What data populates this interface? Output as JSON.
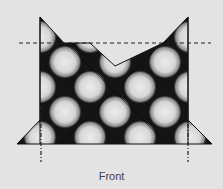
{
  "diagram": {
    "caption": "Front",
    "colors": {
      "background": "#e3e3e3",
      "fabric_dark": "#141414",
      "dot_light": "#e8e8e8",
      "line": "#222222"
    },
    "fold_lines": {
      "horizontal_dashed": "fold-line-top",
      "vertical_dash_dot_left": "fold-line-left",
      "vertical_dash_dot_right": "fold-line-right"
    }
  }
}
